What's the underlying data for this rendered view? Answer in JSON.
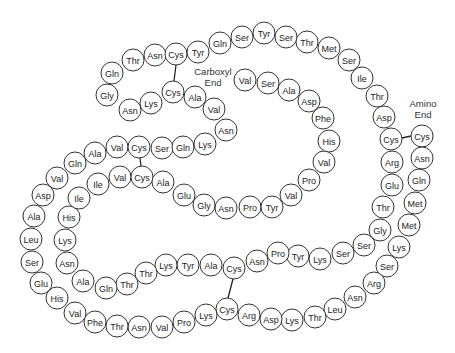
{
  "diagram": {
    "colors": {
      "stroke": "#333333",
      "text": "#222222",
      "background": "#ffffff"
    },
    "labels": {
      "carboxyl": {
        "line1": "Carboxyl",
        "line2": "End",
        "x": 213,
        "y": 72
      },
      "amino": {
        "line1": "Amino",
        "line2": "End",
        "x": 423,
        "y": 104
      }
    },
    "radius": 11,
    "residues": [
      {
        "n": "Cys",
        "x": 422,
        "y": 136
      },
      {
        "n": "Asn",
        "x": 422,
        "y": 158
      },
      {
        "n": "Gln",
        "x": 419,
        "y": 180
      },
      {
        "n": "Met",
        "x": 415,
        "y": 203
      },
      {
        "n": "Met",
        "x": 409,
        "y": 225
      },
      {
        "n": "Lys",
        "x": 399,
        "y": 247
      },
      {
        "n": "Ser",
        "x": 387,
        "y": 266
      },
      {
        "n": "Arg",
        "x": 374,
        "y": 283
      },
      {
        "n": "Asn",
        "x": 355,
        "y": 297
      },
      {
        "n": "Leu",
        "x": 335,
        "y": 309
      },
      {
        "n": "Thr",
        "x": 315,
        "y": 317
      },
      {
        "n": "Lys",
        "x": 292,
        "y": 320
      },
      {
        "n": "Asp",
        "x": 271,
        "y": 319
      },
      {
        "n": "Arg",
        "x": 249,
        "y": 315
      },
      {
        "n": "Cys",
        "x": 227,
        "y": 309
      },
      {
        "n": "Lys",
        "x": 206,
        "y": 315
      },
      {
        "n": "Pro",
        "x": 184,
        "y": 322
      },
      {
        "n": "Val",
        "x": 162,
        "y": 327
      },
      {
        "n": "Asn",
        "x": 139,
        "y": 327
      },
      {
        "n": "Thr",
        "x": 117,
        "y": 326
      },
      {
        "n": "Phe",
        "x": 95,
        "y": 322
      },
      {
        "n": "Val",
        "x": 75,
        "y": 313
      },
      {
        "n": "His",
        "x": 57,
        "y": 298
      },
      {
        "n": "Glu",
        "x": 41,
        "y": 283
      },
      {
        "n": "Ser",
        "x": 32,
        "y": 262
      },
      {
        "n": "Leu",
        "x": 31,
        "y": 239
      },
      {
        "n": "Ala",
        "x": 34,
        "y": 216
      },
      {
        "n": "Asp",
        "x": 43,
        "y": 195
      },
      {
        "n": "Val",
        "x": 57,
        "y": 178
      },
      {
        "n": "Gln",
        "x": 75,
        "y": 163
      },
      {
        "n": "Ala",
        "x": 95,
        "y": 153
      },
      {
        "n": "Val",
        "x": 117,
        "y": 147
      },
      {
        "n": "Cys",
        "x": 139,
        "y": 147
      },
      {
        "n": "Ser",
        "x": 162,
        "y": 148
      },
      {
        "n": "Gln",
        "x": 183,
        "y": 147
      },
      {
        "n": "Lys",
        "x": 205,
        "y": 144
      },
      {
        "n": "Asn",
        "x": 226,
        "y": 130
      },
      {
        "n": "Val",
        "x": 214,
        "y": 109
      },
      {
        "n": "Ala",
        "x": 195,
        "y": 97
      },
      {
        "n": "Cys",
        "x": 173,
        "y": 92
      },
      {
        "n": "Lys",
        "x": 151,
        "y": 103
      },
      {
        "n": "Asn",
        "x": 130,
        "y": 110
      },
      {
        "n": "Gly",
        "x": 107,
        "y": 95
      },
      {
        "n": "Gln",
        "x": 112,
        "y": 73
      },
      {
        "n": "Thr",
        "x": 133,
        "y": 60
      },
      {
        "n": "Asn",
        "x": 155,
        "y": 55
      },
      {
        "n": "Cys",
        "x": 176,
        "y": 54
      },
      {
        "n": "Tyr",
        "x": 198,
        "y": 52
      },
      {
        "n": "Gln",
        "x": 220,
        "y": 43
      },
      {
        "n": "Ser",
        "x": 242,
        "y": 37
      },
      {
        "n": "Tyr",
        "x": 264,
        "y": 33
      },
      {
        "n": "Ser",
        "x": 286,
        "y": 37
      },
      {
        "n": "Thr",
        "x": 307,
        "y": 42
      },
      {
        "n": "Met",
        "x": 329,
        "y": 48
      },
      {
        "n": "Ser",
        "x": 349,
        "y": 60
      },
      {
        "n": "Ile",
        "x": 362,
        "y": 78
      },
      {
        "n": "Thr",
        "x": 377,
        "y": 96
      },
      {
        "n": "Asp",
        "x": 384,
        "y": 117
      },
      {
        "n": "Cys",
        "x": 391,
        "y": 139
      },
      {
        "n": "Arg",
        "x": 392,
        "y": 162
      },
      {
        "n": "Glu",
        "x": 392,
        "y": 185
      },
      {
        "n": "Thr",
        "x": 383,
        "y": 207
      },
      {
        "n": "Gly",
        "x": 380,
        "y": 230
      },
      {
        "n": "Ser",
        "x": 364,
        "y": 245
      },
      {
        "n": "Ser",
        "x": 343,
        "y": 253
      },
      {
        "n": "Lys",
        "x": 320,
        "y": 259
      },
      {
        "n": "Tyr",
        "x": 298,
        "y": 256
      },
      {
        "n": "Pro",
        "x": 278,
        "y": 253
      },
      {
        "n": "Asn",
        "x": 257,
        "y": 261
      },
      {
        "n": "Cys",
        "x": 234,
        "y": 268
      },
      {
        "n": "Ala",
        "x": 211,
        "y": 265
      },
      {
        "n": "Tyr",
        "x": 188,
        "y": 265
      },
      {
        "n": "Lys",
        "x": 166,
        "y": 265
      },
      {
        "n": "Thr",
        "x": 146,
        "y": 273
      },
      {
        "n": "Thr",
        "x": 127,
        "y": 284
      },
      {
        "n": "Gln",
        "x": 106,
        "y": 288
      },
      {
        "n": "Ala",
        "x": 83,
        "y": 281
      },
      {
        "n": "Asn",
        "x": 67,
        "y": 263
      },
      {
        "n": "Lys",
        "x": 65,
        "y": 240
      },
      {
        "n": "His",
        "x": 69,
        "y": 217
      },
      {
        "n": "Ile",
        "x": 79,
        "y": 198
      },
      {
        "n": "Ile",
        "x": 98,
        "y": 184
      },
      {
        "n": "Val",
        "x": 120,
        "y": 177
      },
      {
        "n": "Cys",
        "x": 142,
        "y": 177
      },
      {
        "n": "Ala",
        "x": 163,
        "y": 182
      },
      {
        "n": "Glu",
        "x": 184,
        "y": 195
      },
      {
        "n": "Gly",
        "x": 204,
        "y": 205
      },
      {
        "n": "Asn",
        "x": 226,
        "y": 208
      },
      {
        "n": "Pro",
        "x": 250,
        "y": 207
      },
      {
        "n": "Tyr",
        "x": 272,
        "y": 207
      },
      {
        "n": "Val",
        "x": 291,
        "y": 195
      },
      {
        "n": "Pro",
        "x": 309,
        "y": 180
      },
      {
        "n": "Val",
        "x": 324,
        "y": 162
      },
      {
        "n": "His",
        "x": 329,
        "y": 141
      },
      {
        "n": "Phe",
        "x": 323,
        "y": 118
      },
      {
        "n": "Asp",
        "x": 309,
        "y": 101
      },
      {
        "n": "Ala",
        "x": 289,
        "y": 90
      },
      {
        "n": "Ser",
        "x": 268,
        "y": 83
      },
      {
        "n": "Val",
        "x": 245,
        "y": 80
      }
    ],
    "bonds": [
      {
        "x1": 176,
        "y1": 65,
        "x2": 174,
        "y2": 81
      },
      {
        "x1": 140,
        "y1": 158,
        "x2": 141,
        "y2": 166
      },
      {
        "x1": 233,
        "y1": 279,
        "x2": 228,
        "y2": 298
      },
      {
        "x1": 402,
        "y1": 138,
        "x2": 411,
        "y2": 136
      }
    ]
  }
}
